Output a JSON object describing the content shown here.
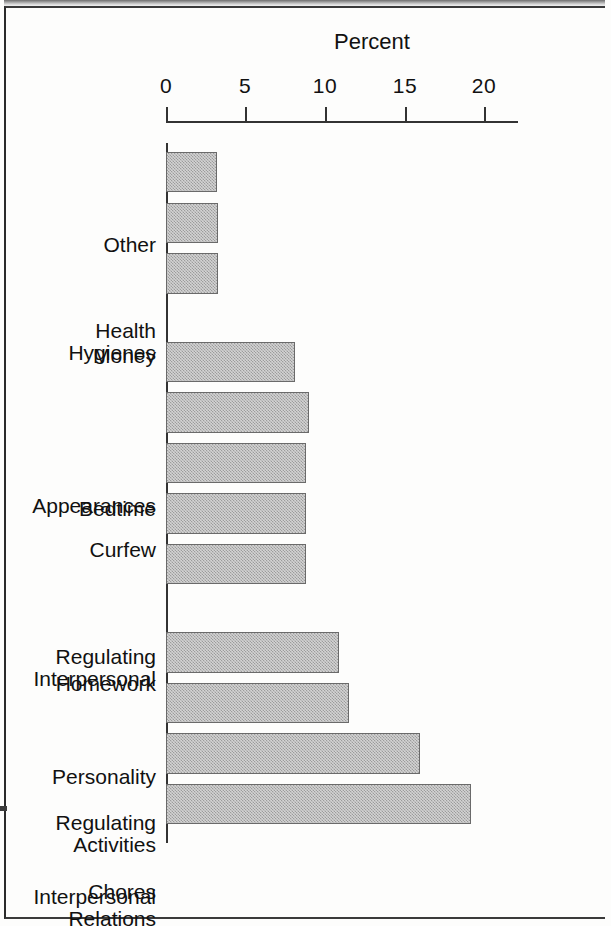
{
  "chart_data": {
    "type": "bar",
    "title": "",
    "subtitle": "",
    "xlabel": "",
    "ylabel": "Percent",
    "orientation": "vertical-bars-on-rotated-page",
    "grid": false,
    "legend": null,
    "axis_ticks": [
      "0",
      "5",
      "10",
      "15",
      "20"
    ],
    "axis_tick_values": [
      0,
      5,
      10,
      15,
      20
    ],
    "ylim": [
      0,
      22
    ],
    "categories": [
      "Other",
      "Health Hygienes",
      "Money",
      "Appearances",
      "Bedtime",
      "Curfew",
      "Regulating Interpersonal",
      "Homework",
      "Personality",
      "Regulating Activities",
      "Interpersonal Relations",
      "Chores"
    ],
    "values": [
      3.2,
      3.3,
      3.3,
      8.1,
      9.0,
      8.8,
      8.8,
      8.8,
      10.9,
      11.5,
      16.0,
      19.2
    ],
    "bars": [
      {
        "label_line1": "Other",
        "label_line2": "",
        "value": 3.2,
        "gap_before": false
      },
      {
        "label_line1": "Health",
        "label_line2": "Hygienes",
        "value": 3.3,
        "gap_before": false
      },
      {
        "label_line1": "Money",
        "label_line2": "",
        "value": 3.3,
        "gap_before": false
      },
      {
        "label_line1": "Appearances",
        "label_line2": "",
        "value": 8.1,
        "gap_before": true
      },
      {
        "label_line1": "Bedtime",
        "label_line2": "",
        "value": 9.0,
        "gap_before": false
      },
      {
        "label_line1": "Curfew",
        "label_line2": "",
        "value": 8.8,
        "gap_before": false
      },
      {
        "label_line1": "Regulating",
        "label_line2": "Interpersonal",
        "value": 8.8,
        "gap_before": false
      },
      {
        "label_line1": "Homework",
        "label_line2": "",
        "value": 8.8,
        "gap_before": false
      },
      {
        "label_line1": "Personality",
        "label_line2": "",
        "value": 10.9,
        "gap_before": true
      },
      {
        "label_line1": "Regulating",
        "label_line2": "Activities",
        "value": 11.5,
        "gap_before": false
      },
      {
        "label_line1": "Interpersonal",
        "label_line2": "Relations",
        "value": 16.0,
        "gap_before": false
      },
      {
        "label_line1": "Chores",
        "label_line2": "",
        "value": 19.2,
        "gap_before": false
      }
    ],
    "colors": {
      "bar_fill": "#d3d3d3",
      "bar_hatch": "#787878",
      "bar_border": "#6a6a6a",
      "axis": "#333333",
      "text": "#111111",
      "background": "#fdfdfc"
    }
  }
}
